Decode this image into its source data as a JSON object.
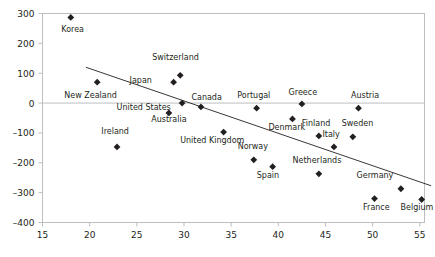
{
  "chart_data": {
    "type": "scatter",
    "title": "",
    "subtitle": "",
    "xlabel": "",
    "ylabel": "",
    "xlim": [
      15,
      55.5
    ],
    "ylim": [
      -400,
      300
    ],
    "xticks": [
      15,
      20,
      25,
      30,
      35,
      40,
      45,
      50,
      55
    ],
    "yticks": [
      -400,
      -300,
      -200,
      -100,
      0,
      100,
      200,
      300
    ],
    "xtick_labels": [
      "15",
      "20",
      "25",
      "30",
      "35",
      "40",
      "45",
      "50",
      "55"
    ],
    "ytick_labels": [
      "–400",
      "–300",
      "–200",
      "–100",
      "0",
      "100",
      "200",
      "300"
    ],
    "grid": false,
    "legend": "none",
    "zero_line": true,
    "marker": "diamond",
    "marker_color": "#231f20",
    "frame_color": "#bcbec0",
    "trendline": {
      "show": true,
      "color": "#231f20",
      "x": [
        19.6,
        56.2
      ],
      "y": [
        120,
        -277
      ]
    },
    "points": [
      {
        "label": "Korea",
        "x": 18.0,
        "y": 287,
        "lx": 18.2,
        "ly": 237,
        "anchor": "middle"
      },
      {
        "label": "New Zealand",
        "x": 20.8,
        "y": 70,
        "lx": 20.1,
        "ly": 17,
        "anchor": "middle"
      },
      {
        "label": "Ireland",
        "x": 22.9,
        "y": -147,
        "lx": 22.7,
        "ly": -104,
        "anchor": "middle"
      },
      {
        "label": "Switzerland",
        "x": 29.6,
        "y": 93,
        "lx": 29.1,
        "ly": 143,
        "anchor": "middle"
      },
      {
        "label": "Japan",
        "x": 28.9,
        "y": 70,
        "lx": 26.6,
        "ly": 67,
        "anchor": "end"
      },
      {
        "label": "United States",
        "x": 29.8,
        "y": 0,
        "lx": 28.6,
        "ly": -22,
        "anchor": "end"
      },
      {
        "label": "Australia",
        "x": 28.4,
        "y": -33,
        "lx": 28.4,
        "ly": -63,
        "anchor": "middle"
      },
      {
        "label": "Canada",
        "x": 31.8,
        "y": -13,
        "lx": 32.4,
        "ly": 10,
        "anchor": "middle"
      },
      {
        "label": "United Kingdom",
        "x": 34.2,
        "y": -97,
        "lx": 33.0,
        "ly": -134,
        "anchor": "middle"
      },
      {
        "label": "Norway",
        "x": 37.4,
        "y": -190,
        "lx": 37.3,
        "ly": -155,
        "anchor": "middle"
      },
      {
        "label": "Spain",
        "x": 39.4,
        "y": -213,
        "lx": 38.9,
        "ly": -250,
        "anchor": "middle"
      },
      {
        "label": "Portugal",
        "x": 37.7,
        "y": -17,
        "lx": 37.4,
        "ly": 17,
        "anchor": "middle"
      },
      {
        "label": "Denmark",
        "x": 41.5,
        "y": -53,
        "lx": 40.9,
        "ly": -90,
        "anchor": "middle"
      },
      {
        "label": "Greece",
        "x": 42.5,
        "y": -3,
        "lx": 42.6,
        "ly": 27,
        "anchor": "middle"
      },
      {
        "label": "Finland",
        "x": 44.3,
        "y": -110,
        "lx": 44.0,
        "ly": -77,
        "anchor": "middle"
      },
      {
        "label": "Italy",
        "x": 45.9,
        "y": -147,
        "lx": 45.6,
        "ly": -114,
        "anchor": "middle"
      },
      {
        "label": "Sweden",
        "x": 47.9,
        "y": -113,
        "lx": 48.4,
        "ly": -77,
        "anchor": "middle"
      },
      {
        "label": "Austria",
        "x": 48.5,
        "y": -17,
        "lx": 49.2,
        "ly": 17,
        "anchor": "middle"
      },
      {
        "label": "Netherlands",
        "x": 44.3,
        "y": -237,
        "lx": 44.1,
        "ly": -200,
        "anchor": "middle"
      },
      {
        "label": "Germany",
        "x": 53.0,
        "y": -287,
        "lx": 52.2,
        "ly": -250,
        "anchor": "end"
      },
      {
        "label": "France",
        "x": 50.2,
        "y": -320,
        "lx": 50.4,
        "ly": -357,
        "anchor": "middle"
      },
      {
        "label": "Belgium",
        "x": 55.2,
        "y": -323,
        "lx": 54.7,
        "ly": -357,
        "anchor": "middle"
      }
    ]
  }
}
